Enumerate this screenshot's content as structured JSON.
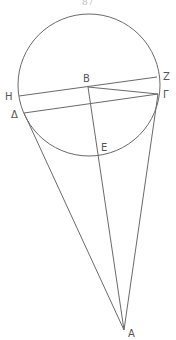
{
  "diagram": {
    "type": "geometry",
    "circle": {
      "cx": 89,
      "cy": 85,
      "r": 71
    },
    "points": {
      "B": {
        "x": 88,
        "y": 87
      },
      "Z": {
        "x": 157,
        "y": 77
      },
      "Gamma": {
        "x": 158,
        "y": 94
      },
      "H": {
        "x": 19,
        "y": 96
      },
      "Delta": {
        "x": 24,
        "y": 113
      },
      "E": {
        "x": 98,
        "y": 156
      },
      "A": {
        "x": 124,
        "y": 330
      }
    },
    "labels": {
      "B": "B",
      "Z": "Z",
      "Gamma": "Γ",
      "H": "H",
      "Delta": "Δ",
      "E": "E",
      "A": "A",
      "top_fragment": "87"
    },
    "segments": [
      [
        "H",
        "Z"
      ],
      [
        "Delta",
        "Gamma"
      ],
      [
        "B",
        "Gamma"
      ],
      [
        "B",
        "A"
      ],
      [
        "Delta",
        "A"
      ],
      [
        "Gamma",
        "A"
      ]
    ],
    "colors": {
      "line": "#6a6a6a",
      "label": "#555555"
    }
  }
}
